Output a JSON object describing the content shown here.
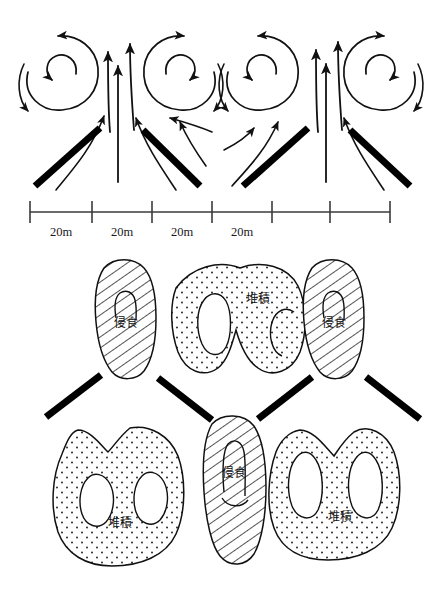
{
  "figure": {
    "title": "",
    "panels": [
      {
        "id": "flow-panel",
        "name": "upper-flow-pattern",
        "description": "secondary-flow-vortex-pattern"
      },
      {
        "id": "bed-panel",
        "name": "lower-bed-pattern",
        "description": "erosion-deposition-plan"
      }
    ]
  },
  "scale": {
    "unit_label": "20m",
    "segments": [
      "20m",
      "20m",
      "20m",
      "20m"
    ],
    "tick_count": 7,
    "tick_positions_px": [
      30,
      92,
      152,
      212,
      272,
      330,
      390
    ],
    "axis_y_px": 212,
    "label_y_px": 232
  },
  "flow_panel": {
    "vortices": [
      {
        "name": "vortex-1",
        "cx": 60,
        "cy": 75,
        "rotation": "counterclockwise"
      },
      {
        "name": "vortex-2",
        "cx": 178,
        "cy": 75,
        "rotation": "clockwise"
      },
      {
        "name": "vortex-3",
        "cx": 262,
        "cy": 75,
        "rotation": "counterclockwise"
      },
      {
        "name": "vortex-4",
        "cx": 378,
        "cy": 75,
        "rotation": "clockwise"
      }
    ],
    "groynes": [
      {
        "name": "groyne-1",
        "x1": 35,
        "y1": 185,
        "x2": 100,
        "y2": 128,
        "slope": "up-right"
      },
      {
        "name": "groyne-2",
        "x1": 143,
        "y1": 130,
        "x2": 200,
        "y2": 185,
        "slope": "down-right"
      },
      {
        "name": "groyne-3",
        "x1": 243,
        "y1": 185,
        "x2": 308,
        "y2": 128,
        "slope": "up-right"
      },
      {
        "name": "groyne-4",
        "x1": 350,
        "y1": 130,
        "x2": 410,
        "y2": 185,
        "slope": "down-right"
      }
    ],
    "upwelling_arrows": 6,
    "flow_type": "converging-upflow-with-paired-helical-cells"
  },
  "bed_panel": {
    "erosion_label": "侵食",
    "deposition_label": "堆積",
    "zones": [
      {
        "name": "erosion-zone-upper-left",
        "type": "erosion",
        "label": "侵食",
        "pattern": "hatched",
        "cx": 124,
        "cy": 318
      },
      {
        "name": "deposition-zone-upper-center",
        "type": "deposition",
        "label": "堆積",
        "pattern": "stippled",
        "cx": 243,
        "cy": 300
      },
      {
        "name": "erosion-zone-upper-right",
        "type": "erosion",
        "label": "侵食",
        "pattern": "hatched",
        "cx": 332,
        "cy": 318
      },
      {
        "name": "deposition-zone-lower-left",
        "type": "deposition",
        "label": "堆積",
        "pattern": "stippled",
        "cx": 117,
        "cy": 518
      },
      {
        "name": "erosion-zone-lower-center",
        "type": "erosion",
        "label": "侵食",
        "pattern": "hatched",
        "cx": 232,
        "cy": 480
      },
      {
        "name": "deposition-zone-lower-right",
        "type": "deposition",
        "label": "堆積",
        "pattern": "stippled",
        "cx": 345,
        "cy": 510
      }
    ],
    "groynes": [
      {
        "name": "groyne-a",
        "x1": 46,
        "y1": 416,
        "x2": 101,
        "y2": 375,
        "slope": "up-right"
      },
      {
        "name": "groyne-b",
        "x1": 158,
        "y1": 378,
        "x2": 212,
        "y2": 420,
        "slope": "down-right"
      },
      {
        "name": "groyne-c",
        "x1": 258,
        "y1": 418,
        "x2": 312,
        "y2": 377,
        "slope": "up-right"
      },
      {
        "name": "groyne-d",
        "x1": 366,
        "y1": 377,
        "x2": 420,
        "y2": 419,
        "slope": "down-right"
      }
    ]
  },
  "colors": {
    "ink": "#111111",
    "line": "#2a2a2a",
    "background": "#ffffff",
    "groyne": "#000000"
  }
}
